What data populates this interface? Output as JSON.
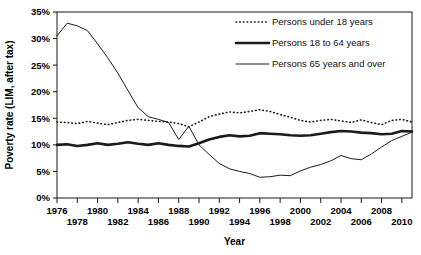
{
  "chart_data": {
    "type": "line",
    "title": "",
    "xlabel": "Year",
    "ylabel": "Poverty rate (LIM, after tax)",
    "xlim": [
      1976,
      2011
    ],
    "ylim": [
      0,
      35
    ],
    "ytick_labels": [
      "0%",
      "5%",
      "10%",
      "15%",
      "20%",
      "25%",
      "30%",
      "35%"
    ],
    "ytick_values": [
      0,
      5,
      10,
      15,
      20,
      25,
      30,
      35
    ],
    "xtick_values": [
      1976,
      1978,
      1980,
      1982,
      1984,
      1986,
      1988,
      1990,
      1992,
      1994,
      1996,
      1998,
      2000,
      2002,
      2004,
      2006,
      2008,
      2010
    ],
    "xtick_labels_upper": [
      "1976",
      "1980",
      "1984",
      "1988",
      "1992",
      "1996",
      "2000",
      "2004",
      "2008"
    ],
    "xtick_labels_lower": [
      "1978",
      "1982",
      "1986",
      "1990",
      "1994",
      "1998",
      "2002",
      "2006",
      "2010"
    ],
    "grid": false,
    "legend_position": "top-right",
    "x": [
      1976,
      1977,
      1978,
      1979,
      1980,
      1981,
      1982,
      1983,
      1984,
      1985,
      1986,
      1987,
      1988,
      1989,
      1990,
      1991,
      1992,
      1993,
      1994,
      1995,
      1996,
      1997,
      1998,
      1999,
      2000,
      2001,
      2002,
      2003,
      2004,
      2005,
      2006,
      2007,
      2008,
      2009,
      2010,
      2011
    ],
    "series": [
      {
        "name": "Persons under 18 years",
        "style": "dotted",
        "values": [
          14.3,
          14.2,
          14.0,
          14.4,
          14.1,
          13.8,
          14.2,
          14.6,
          14.8,
          14.6,
          14.4,
          14.3,
          14.0,
          13.4,
          14.3,
          15.3,
          15.8,
          16.2,
          16.0,
          16.3,
          16.6,
          16.3,
          15.7,
          15.2,
          14.6,
          14.3,
          14.6,
          14.8,
          14.5,
          14.2,
          14.7,
          14.2,
          13.8,
          14.6,
          14.8,
          14.3
        ]
      },
      {
        "name": "Persons 18 to 64 years",
        "style": "thick",
        "values": [
          10.0,
          10.1,
          9.8,
          10.0,
          10.3,
          10.0,
          10.2,
          10.5,
          10.2,
          10.0,
          10.3,
          10.0,
          9.8,
          9.7,
          10.3,
          11.0,
          11.5,
          11.8,
          11.6,
          11.7,
          12.2,
          12.1,
          12.0,
          11.8,
          11.7,
          11.8,
          12.1,
          12.4,
          12.6,
          12.5,
          12.3,
          12.2,
          12.0,
          12.1,
          12.6,
          12.5
        ]
      },
      {
        "name": "Persons 65 years and over",
        "style": "thin",
        "values": [
          30.5,
          32.9,
          32.4,
          31.5,
          29.0,
          26.4,
          23.5,
          20.2,
          17.0,
          15.3,
          14.8,
          14.2,
          11.0,
          13.5,
          10.0,
          8.2,
          6.5,
          5.5,
          5.0,
          4.6,
          3.9,
          4.0,
          4.3,
          4.2,
          5.1,
          5.8,
          6.3,
          7.0,
          8.0,
          7.4,
          7.2,
          8.3,
          9.6,
          10.8,
          11.6,
          12.4
        ]
      }
    ],
    "legend": [
      {
        "label": "Persons under 18 years",
        "style": "dotted"
      },
      {
        "label": "Persons 18 to 64 years",
        "style": "thick"
      },
      {
        "label": "Persons 65 years and over",
        "style": "thin"
      }
    ]
  }
}
